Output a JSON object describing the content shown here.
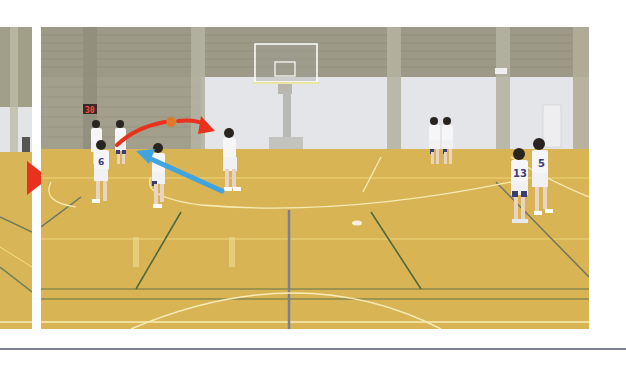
{
  "figure": {
    "type": "photo",
    "panels": [
      {
        "id": "left",
        "description": "cropped previous photo panel edge"
      },
      {
        "id": "main",
        "description": "players passing ball with overlaid arrows"
      }
    ]
  },
  "scene": {
    "shot_clock": "30",
    "jersey_numbers": [
      "13",
      "5",
      "6"
    ],
    "ball_color": "#e07a2a"
  },
  "overlays": {
    "pass_arrow": {
      "color": "#e8321e",
      "meaning": "ball pass trajectory"
    },
    "cut_arrow": {
      "color": "#3fa4e0",
      "meaning": "player movement"
    },
    "panel_marker": {
      "color": "#e8321e",
      "shape": "triangle-right"
    }
  },
  "colors": {
    "floor": "#d9b455",
    "wall_upper": "#9a9a86",
    "wall_lower": "#e6e7ea",
    "rule_line": "#7b7f96"
  }
}
